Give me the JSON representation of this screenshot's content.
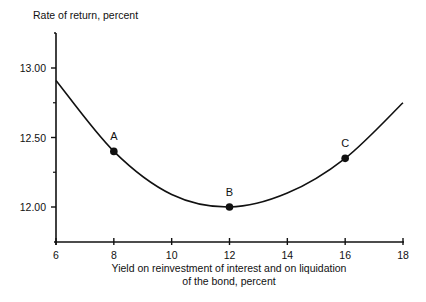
{
  "chart_data": {
    "type": "line",
    "title": "",
    "ylabel": "Rate of return, percent",
    "xlabel_lines": [
      "Yield on reinvestment of interest and on liquidation",
      "of the bond, percent"
    ],
    "xlabel": "Yield on reinvestment of interest and on liquidation of the bond, percent",
    "xlim": [
      6,
      18
    ],
    "ylim": [
      11.75,
      13.25
    ],
    "x_ticks": [
      6,
      8,
      10,
      12,
      14,
      16,
      18
    ],
    "x_tick_labels": [
      "6",
      "8",
      "10",
      "12",
      "14",
      "16",
      "18"
    ],
    "y_ticks": [
      12.0,
      12.5,
      13.0
    ],
    "y_tick_labels": [
      "12.00",
      "12.50",
      "13.00"
    ],
    "y_minor_ticks": [
      12.25,
      12.75
    ],
    "grid": false,
    "legend": null,
    "series": [
      {
        "name": "Rate of return",
        "x": [
          6,
          8,
          10,
          12,
          14,
          16,
          18
        ],
        "values": [
          12.91,
          12.4,
          12.09,
          12.0,
          12.1,
          12.35,
          12.75
        ]
      }
    ],
    "annotations": [
      {
        "label": "A",
        "x": 8,
        "y": 12.4
      },
      {
        "label": "B",
        "x": 12,
        "y": 12.0
      },
      {
        "label": "C",
        "x": 16,
        "y": 12.35
      }
    ]
  }
}
